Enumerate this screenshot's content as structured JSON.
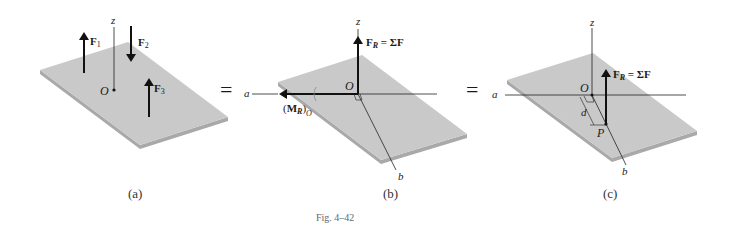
{
  "figure": {
    "caption": "Fig. 4–42",
    "equals_sign": "=",
    "panels": [
      {
        "id": "a",
        "label": "(a)",
        "axis_z": "z",
        "origin": "O",
        "forces": [
          {
            "name": "F",
            "sub": "1",
            "direction": "up"
          },
          {
            "name": "F",
            "sub": "2",
            "direction": "down"
          },
          {
            "name": "F",
            "sub": "3",
            "direction": "up"
          }
        ]
      },
      {
        "id": "b",
        "label": "(b)",
        "axis_z": "z",
        "axis_a": "a",
        "axis_b": "b",
        "origin": "O",
        "resultant_force": {
          "name": "F",
          "sub": "R",
          "eq": " = ΣF"
        },
        "resultant_moment": {
          "open": "(",
          "name": "M",
          "sub": "R",
          "close": ")",
          "sub2": "O"
        }
      },
      {
        "id": "c",
        "label": "(c)",
        "axis_z": "z",
        "axis_a": "a",
        "axis_b": "b",
        "origin": "O",
        "point": "P",
        "distance": "d",
        "resultant_force": {
          "name": "F",
          "sub": "R",
          "eq": " = ΣF"
        }
      }
    ],
    "colors": {
      "plate_top": "#c9c9c9",
      "plate_edge": "#a8a8a8",
      "line": "#1a1a1a"
    }
  }
}
